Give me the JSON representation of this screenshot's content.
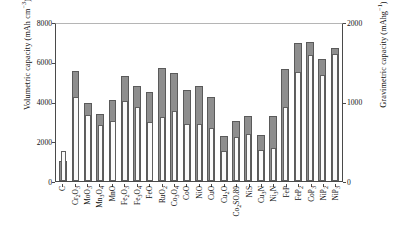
{
  "chart_data": {
    "type": "bar",
    "title": "",
    "xlabel": "",
    "ylabel": "Volumetric capacity (mAh cm−3)",
    "y2label": "Gravimetric capacity (mAhg−1)",
    "ylim": [
      0,
      8000
    ],
    "y2lim": [
      0,
      2000
    ],
    "yticks": [
      0,
      2000,
      4000,
      6000,
      8000
    ],
    "y2ticks": [
      0,
      1000,
      2000
    ],
    "grid": false,
    "legend": "none",
    "categories": [
      "C",
      "Cr2O3",
      "MoO3",
      "Mn3O4",
      "MnO",
      "Fe2O3",
      "Fe3O4",
      "FeO",
      "RuO2",
      "Co3O4",
      "CoO",
      "NiO",
      "CuO",
      "Cu2O",
      "Co2SO.89",
      "NiS",
      "Cu3N",
      "Ni3N",
      "FeP",
      "FeP2",
      "CoP3",
      "NiP2",
      "NiP3"
    ],
    "series": [
      {
        "name": "Volumetric capacity",
        "axis": "left",
        "color": "#8e8e8e",
        "values": [
          1000,
          5520,
          3950,
          3370,
          4060,
          5290,
          4760,
          4460,
          5670,
          5440,
          4570,
          4790,
          4220,
          2250,
          3000,
          3250,
          2300,
          3270,
          5640,
          6960,
          6980,
          6120,
          6670
        ]
      },
      {
        "name": "Gravimetric capacity",
        "axis": "right",
        "color": "#fbfbfb",
        "values": [
          375,
          1055,
          835,
          705,
          755,
          1005,
          925,
          745,
          805,
          885,
          715,
          715,
          670,
          375,
          550,
          590,
          390,
          420,
          925,
          1365,
          1585,
          1335,
          1595
        ]
      }
    ]
  },
  "axes": {
    "left_title_parts": {
      "main": "Volumetric capacity (mAh cm",
      "sup": "−3",
      "tail": ")"
    },
    "right_title_parts": {
      "main": "Gravimetric capacity (mAhg",
      "sup": "−1",
      "tail": ")"
    },
    "left_ticklabels": [
      "8000",
      "6000",
      "4000",
      "2000",
      "0"
    ],
    "right_ticklabels": [
      "2000",
      "1000",
      "0"
    ]
  },
  "xtick_labels": [
    {
      "parts": [
        {
          "t": "C"
        }
      ]
    },
    {
      "parts": [
        {
          "t": "Cr"
        },
        {
          "t": "2",
          "s": "sub"
        },
        {
          "t": "O"
        },
        {
          "t": "3",
          "s": "sub"
        }
      ]
    },
    {
      "parts": [
        {
          "t": "MoO"
        },
        {
          "t": "3",
          "s": "sub"
        }
      ]
    },
    {
      "parts": [
        {
          "t": "Mn"
        },
        {
          "t": "3",
          "s": "sub"
        },
        {
          "t": "O"
        },
        {
          "t": "4",
          "s": "sub"
        }
      ]
    },
    {
      "parts": [
        {
          "t": "MnO"
        }
      ]
    },
    {
      "parts": [
        {
          "t": "Fe"
        },
        {
          "t": "2",
          "s": "sub"
        },
        {
          "t": "O"
        },
        {
          "t": "3",
          "s": "sub"
        }
      ]
    },
    {
      "parts": [
        {
          "t": "Fe"
        },
        {
          "t": "3",
          "s": "sub"
        },
        {
          "t": "O"
        },
        {
          "t": "4",
          "s": "sub"
        }
      ]
    },
    {
      "parts": [
        {
          "t": "FeO"
        }
      ]
    },
    {
      "parts": [
        {
          "t": "RuO"
        },
        {
          "t": "2",
          "s": "sub"
        }
      ]
    },
    {
      "parts": [
        {
          "t": "Co"
        },
        {
          "t": "3",
          "s": "sub"
        },
        {
          "t": "O"
        },
        {
          "t": "4",
          "s": "sub"
        }
      ]
    },
    {
      "parts": [
        {
          "t": "CoO"
        }
      ]
    },
    {
      "parts": [
        {
          "t": "NiO"
        }
      ]
    },
    {
      "parts": [
        {
          "t": "CuO"
        }
      ]
    },
    {
      "parts": [
        {
          "t": "Cu"
        },
        {
          "t": "2",
          "s": "sub"
        },
        {
          "t": "O"
        }
      ]
    },
    {
      "parts": [
        {
          "t": "Co"
        },
        {
          "t": "2",
          "s": "sub"
        },
        {
          "t": "SO.89"
        }
      ]
    },
    {
      "parts": [
        {
          "t": "NiS"
        }
      ]
    },
    {
      "parts": [
        {
          "t": "Cu"
        },
        {
          "t": "3",
          "s": "sub"
        },
        {
          "t": "N"
        }
      ]
    },
    {
      "parts": [
        {
          "t": "Ni"
        },
        {
          "t": "3",
          "s": "sub"
        },
        {
          "t": "N"
        }
      ]
    },
    {
      "parts": [
        {
          "t": "FeP"
        }
      ]
    },
    {
      "parts": [
        {
          "t": "FeP"
        },
        {
          "t": "2",
          "s": "sub"
        }
      ]
    },
    {
      "parts": [
        {
          "t": "CoP"
        },
        {
          "t": "3",
          "s": "sub"
        }
      ]
    },
    {
      "parts": [
        {
          "t": "NiP"
        },
        {
          "t": "2",
          "s": "sub"
        }
      ]
    },
    {
      "parts": [
        {
          "t": "NiP"
        },
        {
          "t": "3",
          "s": "sub"
        }
      ]
    }
  ]
}
